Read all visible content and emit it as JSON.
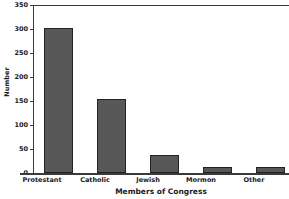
{
  "chart_data": {
    "type": "bar",
    "title": "",
    "subtitle": "",
    "xlabel": "Members of Congress",
    "ylabel": "Number",
    "categories": [
      "Protestant",
      "Catholic",
      "Jewish",
      "Mormon",
      "Other"
    ],
    "values": [
      303,
      154,
      37,
      13,
      12
    ],
    "series": [
      {
        "name": "Number",
        "values": [
          303,
          154,
          37,
          13,
          12
        ]
      }
    ],
    "ylim": [
      0,
      350
    ],
    "ytick_labels": [
      "0",
      "50",
      "100",
      "150",
      "200",
      "250",
      "300",
      "350"
    ],
    "ytick_values": [
      0,
      50,
      100,
      150,
      200,
      250,
      300,
      350
    ],
    "grid": false,
    "legend": null,
    "legend_position": "none",
    "bar_fill_color": "#585858",
    "bar_edge_color": "#222222",
    "axis_color": "#3a3a3a",
    "background_color": "#ffffff",
    "annotations": []
  }
}
